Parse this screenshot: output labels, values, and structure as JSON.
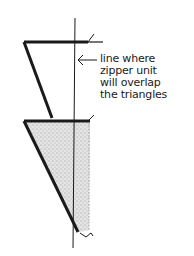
{
  "diagram": {
    "annotation": {
      "lines": [
        "line where",
        "zipper unit",
        "will overlap",
        "the triangles"
      ]
    },
    "colors": {
      "ink": "#1a1a1a",
      "stipple": "#bdbdbd",
      "background": "#ffffff"
    }
  }
}
